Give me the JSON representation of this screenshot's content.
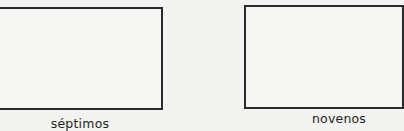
{
  "figures": [
    {
      "id": "left",
      "label": "séptimos"
    },
    {
      "id": "right",
      "label": "novenos"
    }
  ]
}
